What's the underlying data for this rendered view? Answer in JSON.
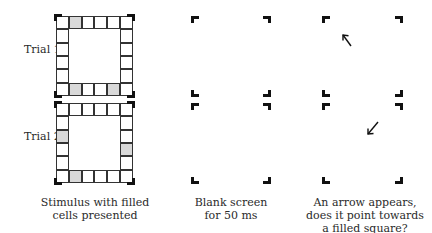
{
  "figure": {
    "trial_labels": [
      "Trial 1",
      "Trial 2"
    ],
    "panels": [
      {
        "id": "stimulus",
        "caption_lines": [
          "Stimulus with filled",
          "cells presented"
        ]
      },
      {
        "id": "blank",
        "caption_lines": [
          "Blank screen",
          "for 50 ms"
        ]
      },
      {
        "id": "arrow",
        "caption_lines": [
          "An arrow appears,",
          "does it point towards",
          "a filled square?"
        ]
      }
    ],
    "grids": [
      {
        "trial": "Trial 1",
        "size": 6,
        "filled_cells": [
          [
            0,
            1
          ],
          [
            5,
            1
          ],
          [
            5,
            4
          ]
        ]
      },
      {
        "trial": "Trial 2",
        "size": 6,
        "filled_cells": [
          [
            2,
            0
          ],
          [
            3,
            5
          ],
          [
            5,
            1
          ]
        ]
      }
    ],
    "arrows": [
      {
        "trial": "Trial 1",
        "direction": "up-left"
      },
      {
        "trial": "Trial 2",
        "direction": "down-left"
      }
    ],
    "colors": {
      "filled_cell": "#d9d9d9",
      "grid_line": "#333333",
      "bracket": "#111111"
    }
  }
}
